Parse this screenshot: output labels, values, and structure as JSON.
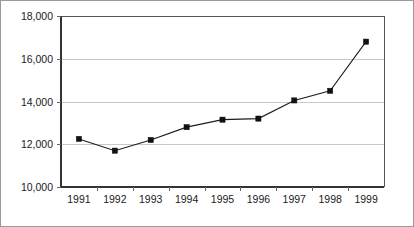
{
  "chart_data": {
    "type": "line",
    "title": "",
    "subtitle": "",
    "xlabel": "",
    "ylabel": "",
    "categories": [
      "1991",
      "1992",
      "1993",
      "1994",
      "1995",
      "1996",
      "1997",
      "1998",
      "1999"
    ],
    "values": [
      12250,
      11700,
      12200,
      12800,
      13150,
      13200,
      14050,
      14500,
      16800
    ],
    "series": [
      {
        "name": "",
        "values": [
          12250,
          11700,
          12200,
          12800,
          13150,
          13200,
          14050,
          14500,
          16800
        ]
      }
    ],
    "ylim": [
      10000,
      18000
    ],
    "ytick_values": [
      10000,
      12000,
      14000,
      16000,
      18000
    ],
    "ytick_labels": [
      "10,000",
      "12,000",
      "14,000",
      "16,000",
      "18,000"
    ],
    "xtick_labels": [
      "1991",
      "1992",
      "1993",
      "1994",
      "1995",
      "1996",
      "1997",
      "1998",
      "1999"
    ],
    "grid": true,
    "grid_axis": "y",
    "legend": false,
    "legend_position": "none",
    "marker": "square",
    "line_color": "#1c1c1c",
    "marker_color": "#111111",
    "grid_color": "#c9c9c9",
    "frame_color": "#555555",
    "background_color": "#ffffff",
    "annotations": []
  },
  "figure": {
    "border_color": "#9a9a9a"
  }
}
